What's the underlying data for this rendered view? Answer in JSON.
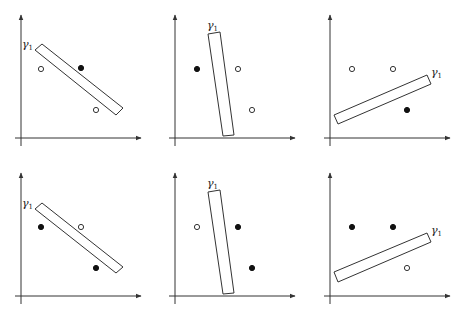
{
  "diagram": {
    "label": "γ",
    "label_sub": "1",
    "panels": [
      {
        "id": "top-left",
        "ox": 21,
        "oy": 138,
        "rect": [
          [
            35,
            50
          ],
          [
            42,
            44
          ],
          [
            123,
            108
          ],
          [
            116,
            115
          ]
        ],
        "label_pos": [
          22,
          48
        ],
        "points": [
          {
            "x": 41,
            "y": 69,
            "type": "hollow"
          },
          {
            "x": 81,
            "y": 68,
            "type": "filled"
          },
          {
            "x": 96,
            "y": 110,
            "type": "hollow"
          }
        ]
      },
      {
        "id": "top-middle",
        "ox": 175,
        "oy": 138,
        "rect": [
          [
            208,
            34
          ],
          [
            220,
            32
          ],
          [
            234,
            135
          ],
          [
            223,
            136
          ]
        ],
        "label_pos": [
          207,
          29
        ],
        "points": [
          {
            "x": 197,
            "y": 69,
            "type": "filled"
          },
          {
            "x": 238,
            "y": 69,
            "type": "hollow"
          },
          {
            "x": 252,
            "y": 110,
            "type": "hollow"
          }
        ]
      },
      {
        "id": "top-right",
        "ox": 330,
        "oy": 138,
        "rect": [
          [
            334,
            115
          ],
          [
            338,
            124
          ],
          [
            431,
            84
          ],
          [
            427,
            75
          ]
        ],
        "label_pos": [
          431,
          76
        ],
        "points": [
          {
            "x": 352,
            "y": 69,
            "type": "hollow"
          },
          {
            "x": 393,
            "y": 69,
            "type": "hollow"
          },
          {
            "x": 407,
            "y": 110,
            "type": "filled"
          }
        ]
      },
      {
        "id": "bottom-left",
        "ox": 21,
        "oy": 296,
        "rect": [
          [
            35,
            209
          ],
          [
            42,
            203
          ],
          [
            123,
            267
          ],
          [
            116,
            273
          ]
        ],
        "label_pos": [
          22,
          207
        ],
        "points": [
          {
            "x": 41,
            "y": 227,
            "type": "filled"
          },
          {
            "x": 81,
            "y": 227,
            "type": "hollow"
          },
          {
            "x": 96,
            "y": 268,
            "type": "filled"
          }
        ]
      },
      {
        "id": "bottom-middle",
        "ox": 175,
        "oy": 296,
        "rect": [
          [
            208,
            192
          ],
          [
            220,
            190
          ],
          [
            234,
            293
          ],
          [
            223,
            294
          ]
        ],
        "label_pos": [
          207,
          187
        ],
        "points": [
          {
            "x": 197,
            "y": 227,
            "type": "hollow"
          },
          {
            "x": 238,
            "y": 227,
            "type": "filled"
          },
          {
            "x": 252,
            "y": 268,
            "type": "filled"
          }
        ]
      },
      {
        "id": "bottom-right",
        "ox": 330,
        "oy": 296,
        "rect": [
          [
            334,
            272
          ],
          [
            338,
            282
          ],
          [
            431,
            242
          ],
          [
            427,
            233
          ]
        ],
        "label_pos": [
          431,
          234
        ],
        "points": [
          {
            "x": 352,
            "y": 227,
            "type": "filled"
          },
          {
            "x": 393,
            "y": 227,
            "type": "filled"
          },
          {
            "x": 407,
            "y": 268,
            "type": "hollow"
          }
        ]
      }
    ]
  }
}
